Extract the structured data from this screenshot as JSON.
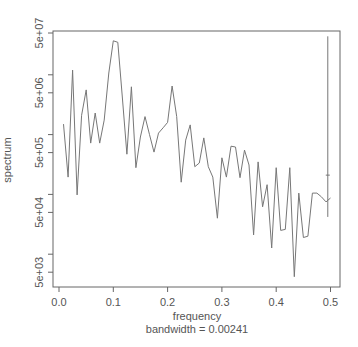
{
  "chart_data": {
    "type": "line",
    "title": "",
    "xlabel": "frequency",
    "sublabel": "bandwidth = 0.00241",
    "ylabel": "spectrum",
    "y_scale": "log",
    "xlim": [
      0.0,
      0.5
    ],
    "ylim": [
      3000,
      60000000
    ],
    "x_ticks": [
      0.0,
      0.1,
      0.2,
      0.3,
      0.4,
      0.5
    ],
    "x_tick_labels": [
      "0.0",
      "0.1",
      "0.2",
      "0.3",
      "0.4",
      "0.5"
    ],
    "y_ticks_labeled": [
      5000,
      50000,
      500000,
      5000000,
      50000000
    ],
    "y_tick_labels": [
      "5e+03",
      "5e+04",
      "5e+05",
      "5e+06",
      "5e+07"
    ],
    "y_ticks_minor": [
      10000,
      100000,
      1000000,
      10000000
    ],
    "grid": false,
    "legend": null,
    "line_color": "#777777",
    "ci_bar": {
      "x": 0.495,
      "y_low": 42000,
      "y_high": 44000000,
      "y_center": 210000
    },
    "series": [
      {
        "name": "spectrum",
        "x": [
          0.00833,
          0.01667,
          0.025,
          0.03333,
          0.04167,
          0.05,
          0.05833,
          0.06667,
          0.075,
          0.08333,
          0.09167,
          0.1,
          0.10833,
          0.11667,
          0.125,
          0.13333,
          0.14167,
          0.15,
          0.15833,
          0.16667,
          0.175,
          0.18333,
          0.19167,
          0.2,
          0.20833,
          0.21667,
          0.225,
          0.23333,
          0.24167,
          0.25,
          0.25833,
          0.26667,
          0.275,
          0.28333,
          0.29167,
          0.3,
          0.30833,
          0.31667,
          0.325,
          0.33333,
          0.34167,
          0.35,
          0.35833,
          0.36667,
          0.375,
          0.38333,
          0.39167,
          0.4,
          0.40833,
          0.41667,
          0.425,
          0.43333,
          0.44167,
          0.45,
          0.45833,
          0.46667,
          0.475,
          0.48333,
          0.49167,
          0.5
        ],
        "values": [
          1500000,
          195000,
          12000000,
          98000,
          2100000,
          5600000,
          720000,
          2300000,
          720000,
          1750000,
          10700000,
          37000000,
          35000000,
          4100000,
          470000,
          6300000,
          280000,
          910000,
          2000000,
          1000000,
          510000,
          1060000,
          1300000,
          1600000,
          6500000,
          2000000,
          160000,
          810000,
          1450000,
          290000,
          335000,
          880000,
          290000,
          195000,
          40000,
          410000,
          195000,
          640000,
          620000,
          190000,
          550000,
          310000,
          21000,
          350000,
          62000,
          145000,
          12700,
          280000,
          25000,
          26000,
          280000,
          4200,
          105000,
          19000,
          20000,
          105000,
          105000,
          91000,
          75000,
          87000
        ]
      }
    ]
  }
}
